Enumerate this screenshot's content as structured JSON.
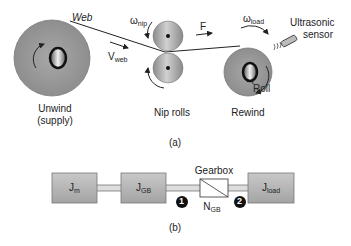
{
  "panel_a": {
    "caption": "(a)",
    "web_label": "Web",
    "v_web": {
      "main": "V",
      "sub": "web"
    },
    "omega_nip": {
      "main": "ω",
      "sub": "nip"
    },
    "force_label": "F",
    "omega_load": {
      "main": "ω",
      "sub": "load"
    },
    "sensor_label_line1": "Ultrasonic",
    "sensor_label_line2": "sensor",
    "roll_label": "Roll",
    "tau_label": "τ",
    "unwind_line1": "Unwind",
    "unwind_line2": "(supply)",
    "nip_label": "Nip rolls",
    "rewind_label": "Rewind"
  },
  "panel_b": {
    "caption": "(b)",
    "jm": {
      "main": "J",
      "sub": "m"
    },
    "jgb": {
      "main": "J",
      "sub": "GB"
    },
    "jload": {
      "main": "J",
      "sub": "load"
    },
    "gearbox_label": "Gearbox",
    "ngb": {
      "main": "N",
      "sub": "GB"
    },
    "marker_1": "1",
    "marker_2": "2"
  },
  "colors": {
    "roll_fill": "#9a9a9a",
    "box_fill": "#b4b4b4",
    "line": "#222222"
  }
}
